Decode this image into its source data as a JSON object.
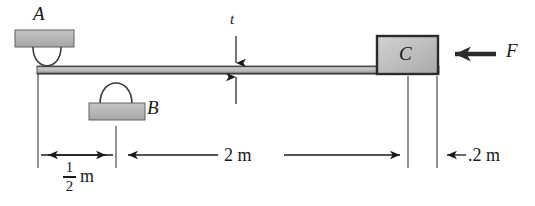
{
  "figure": {
    "type": "statics-beam-diagram",
    "background_color": "#ffffff",
    "ink_color": "#1a1a1a",
    "beam": {
      "fill_color": "#b4b4b4",
      "edge_color": "#4a4a4a",
      "x_start": 37,
      "x_end": 439,
      "y_top": 66,
      "y_bottom": 74,
      "thickness_label": "t"
    },
    "supports": [
      {
        "name": "support-a",
        "label": "A",
        "kind": "pin-above",
        "block_fill": "#b4b4b4",
        "x": 56,
        "y": 66
      },
      {
        "name": "support-b",
        "label": "B",
        "kind": "pin-below",
        "block_fill": "#b4b4b4",
        "x": 116,
        "y": 74
      }
    ],
    "block": {
      "name": "block-c",
      "label": "C",
      "fill_color": "#c0c0c0",
      "edge_color": "#2b2b2b",
      "x_left": 377,
      "x_right": 438,
      "y_top": 36,
      "y_bottom": 74
    },
    "force": {
      "label": "F",
      "direction": "left",
      "applied_to": "block-c",
      "tail_x": 496,
      "head_x": 441,
      "y": 54
    },
    "dimensions": [
      {
        "name": "dim-half-meter",
        "text": "1/2 m",
        "numerator": "1",
        "denominator": "2",
        "unit": "m",
        "from_x": 38,
        "to_x": 116,
        "y": 155
      },
      {
        "name": "dim-two-meters",
        "text": "2 m",
        "value": "2",
        "unit": "m",
        "from_x": 116,
        "to_x": 408,
        "y": 155
      },
      {
        "name": "dim-point-two-meters",
        "text": ".2 m",
        "value": ".2",
        "unit": "m",
        "from_x": 437,
        "to_x": 470,
        "y": 155
      }
    ]
  }
}
